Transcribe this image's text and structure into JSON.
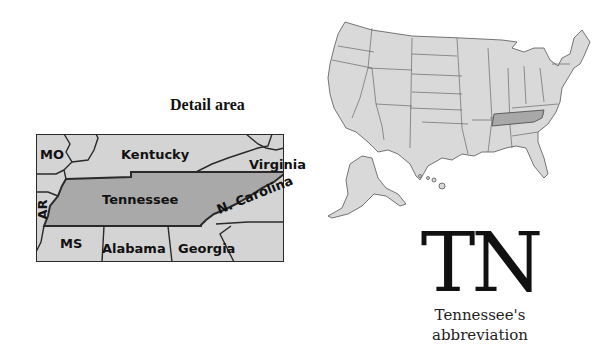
{
  "detail_map": {
    "title": "Detail area",
    "highlight_state": "Tennessee",
    "labels": {
      "mo": "MO",
      "kentucky": "Kentucky",
      "virginia": "Virginia",
      "ar": "AR",
      "tennessee": "Tennessee",
      "n_carolina": "N. Carolina",
      "ms": "MS",
      "alabama": "Alabama",
      "georgia": "Georgia"
    },
    "colors": {
      "highlight": "#a9a9a9",
      "neighbor": "#d4d4d4",
      "border": "#2a2a2a"
    }
  },
  "us_map": {
    "highlight_state": "Tennessee",
    "colors": {
      "fill": "#d9d9d9",
      "highlight": "#a8a8a8",
      "border": "#555555"
    }
  },
  "abbreviation": {
    "code": "TN",
    "caption_line1": "Tennessee's",
    "caption_line2": "abbreviation"
  }
}
